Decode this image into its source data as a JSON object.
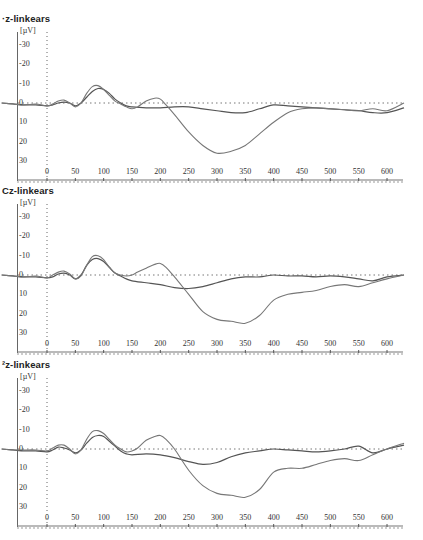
{
  "chart_data": [
    {
      "type": "line",
      "title": "Fz-linkears",
      "title_visible": "·z-linkears",
      "ylabel": "[µV]",
      "xlabel": "",
      "y_inverted": true,
      "ylim": [
        -35,
        35
      ],
      "xlim": [
        -80,
        630
      ],
      "x_ticks": [
        0,
        50,
        100,
        150,
        200,
        250,
        300,
        350,
        400,
        450,
        500,
        550,
        600
      ],
      "y_ticks": [
        -30,
        -20,
        -10,
        0,
        10,
        20,
        30
      ],
      "grid": false,
      "zero_lines": "dotted",
      "legend": null,
      "series": [
        {
          "name": "condition A",
          "color": "#555555",
          "x": [
            -80,
            -60,
            -40,
            -20,
            0,
            10,
            20,
            30,
            40,
            50,
            60,
            70,
            80,
            90,
            100,
            110,
            120,
            130,
            140,
            150,
            175,
            200,
            225,
            250,
            275,
            300,
            325,
            350,
            375,
            400,
            425,
            450,
            475,
            500,
            525,
            550,
            575,
            600,
            630
          ],
          "values": [
            0,
            0.5,
            1,
            1,
            1.5,
            1,
            0,
            -0.5,
            0,
            1.5,
            0,
            -3,
            -6,
            -7.5,
            -7,
            -5,
            -2,
            0,
            1.5,
            2,
            2.5,
            2.5,
            2,
            2,
            3,
            4,
            5,
            5,
            3,
            1,
            1.5,
            2,
            2.5,
            3,
            3.5,
            4,
            5,
            5,
            2.5
          ]
        },
        {
          "name": "condition B",
          "color": "#777777",
          "x": [
            -80,
            -60,
            -40,
            -20,
            0,
            10,
            20,
            30,
            40,
            50,
            60,
            70,
            80,
            90,
            100,
            110,
            120,
            130,
            140,
            150,
            160,
            175,
            190,
            200,
            210,
            225,
            250,
            275,
            300,
            325,
            350,
            375,
            400,
            425,
            450,
            475,
            500,
            525,
            550,
            575,
            600,
            630
          ],
          "values": [
            0,
            0.5,
            1,
            0.5,
            1.5,
            0.5,
            -1,
            -1.5,
            0,
            2,
            0,
            -5,
            -8.5,
            -9,
            -7,
            -4,
            -1,
            0.5,
            2,
            3,
            2,
            -1,
            -2.5,
            -2,
            1,
            6,
            15,
            22,
            26,
            25,
            22,
            16,
            10,
            5,
            3,
            2.5,
            3,
            3.5,
            4,
            3,
            4,
            0
          ]
        }
      ]
    },
    {
      "type": "line",
      "title": "Cz-linkears",
      "title_visible": "Cz-linkears",
      "ylabel": "[µV]",
      "y_inverted": true,
      "ylim": [
        -35,
        35
      ],
      "xlim": [
        -80,
        630
      ],
      "x_ticks": [
        0,
        50,
        100,
        150,
        200,
        250,
        300,
        350,
        400,
        450,
        500,
        550,
        600
      ],
      "y_ticks": [
        -30,
        -20,
        -10,
        0,
        10,
        20,
        30
      ],
      "grid": false,
      "zero_lines": "dotted",
      "legend": null,
      "series": [
        {
          "name": "condition A",
          "color": "#555555",
          "x": [
            -80,
            -60,
            -40,
            -20,
            0,
            10,
            20,
            30,
            40,
            50,
            60,
            70,
            80,
            90,
            100,
            110,
            120,
            130,
            140,
            150,
            175,
            200,
            225,
            250,
            275,
            300,
            325,
            350,
            375,
            400,
            425,
            450,
            475,
            500,
            525,
            550,
            575,
            600,
            630
          ],
          "values": [
            0,
            0.5,
            1,
            1,
            1.5,
            1,
            -0.5,
            -1,
            0,
            2,
            0,
            -5,
            -8,
            -8.5,
            -7,
            -4,
            -1,
            0.5,
            2,
            3,
            4,
            5,
            6.5,
            7,
            6,
            4,
            2,
            1,
            1,
            0,
            0.5,
            0.5,
            1,
            0.5,
            1,
            2,
            3,
            1,
            0
          ]
        },
        {
          "name": "condition B",
          "color": "#777777",
          "x": [
            -80,
            -60,
            -40,
            -20,
            0,
            10,
            20,
            30,
            40,
            50,
            60,
            70,
            80,
            90,
            100,
            110,
            120,
            130,
            140,
            150,
            160,
            175,
            190,
            200,
            210,
            225,
            250,
            275,
            300,
            325,
            350,
            375,
            400,
            425,
            450,
            475,
            500,
            525,
            550,
            575,
            600,
            630
          ],
          "values": [
            0,
            0.5,
            1,
            0.5,
            1.5,
            0,
            -1.5,
            -2,
            -0.5,
            2,
            0.5,
            -5,
            -9.5,
            -10,
            -8,
            -4,
            -1,
            0,
            0.5,
            0,
            -1.5,
            -3.5,
            -5.5,
            -6,
            -4,
            1,
            10,
            19,
            23,
            24,
            25,
            21,
            13,
            10,
            9,
            8,
            6,
            5,
            6,
            4,
            2,
            0
          ]
        }
      ]
    },
    {
      "type": "line",
      "title": "Pz-linkears",
      "title_visible": "²z-linkears",
      "ylabel": "[µV]",
      "y_inverted": true,
      "ylim": [
        -35,
        35
      ],
      "xlim": [
        -80,
        630
      ],
      "x_ticks": [
        0,
        50,
        100,
        150,
        200,
        250,
        300,
        350,
        400,
        450,
        500,
        550,
        600
      ],
      "y_ticks": [
        -30,
        -20,
        -10,
        0,
        10,
        20,
        30
      ],
      "grid": false,
      "zero_lines": "dotted",
      "legend": null,
      "series": [
        {
          "name": "condition A",
          "color": "#555555",
          "x": [
            -80,
            -60,
            -40,
            -20,
            0,
            10,
            20,
            30,
            40,
            50,
            60,
            70,
            80,
            90,
            100,
            110,
            120,
            130,
            140,
            150,
            175,
            200,
            225,
            250,
            275,
            300,
            325,
            350,
            375,
            400,
            425,
            450,
            475,
            500,
            525,
            550,
            575,
            600,
            630
          ],
          "values": [
            0,
            0.5,
            1,
            1,
            1.5,
            0.5,
            -1,
            -0.5,
            0.5,
            2,
            0.5,
            -3,
            -6,
            -7,
            -6.5,
            -4,
            -1.5,
            1,
            2.5,
            3,
            2.5,
            3,
            4.5,
            6.5,
            8,
            7,
            4,
            2,
            1,
            0,
            0.5,
            1,
            1.5,
            1,
            0,
            -1.5,
            2,
            0,
            -2
          ]
        },
        {
          "name": "condition B",
          "color": "#777777",
          "x": [
            -80,
            -60,
            -40,
            -20,
            0,
            10,
            20,
            30,
            40,
            50,
            60,
            70,
            80,
            90,
            100,
            110,
            120,
            130,
            140,
            150,
            160,
            175,
            190,
            200,
            210,
            225,
            250,
            275,
            300,
            325,
            350,
            375,
            400,
            425,
            450,
            475,
            500,
            525,
            550,
            575,
            600,
            630
          ],
          "values": [
            0,
            0.5,
            0.5,
            0.5,
            1,
            -0.5,
            -2,
            -2,
            0,
            2.5,
            0.5,
            -5,
            -9,
            -9.5,
            -8,
            -5,
            -2,
            0,
            1.5,
            1,
            -0.5,
            -4.5,
            -6.5,
            -7,
            -5,
            0,
            11,
            19,
            23,
            24,
            25,
            21,
            12,
            10,
            10,
            8,
            6,
            5,
            6,
            3,
            0,
            -3
          ]
        }
      ]
    }
  ],
  "panels": [
    {
      "title": "·z-linkears",
      "unit": "[µV]",
      "yticks": [
        "-30",
        "-20",
        "-10",
        "0",
        "10",
        "20",
        "30"
      ],
      "xticks": [
        "0",
        "50",
        "100",
        "150",
        "200",
        "250",
        "300",
        "350",
        "400",
        "450",
        "500",
        "550",
        "600"
      ]
    },
    {
      "title": "Cz-linkears",
      "unit": "[µV]",
      "yticks": [
        "-30",
        "-20",
        "-10",
        "0",
        "10",
        "20",
        "30"
      ],
      "xticks": [
        "0",
        "50",
        "100",
        "150",
        "200",
        "250",
        "300",
        "350",
        "400",
        "450",
        "500",
        "550",
        "600"
      ]
    },
    {
      "title": "²z-linkears",
      "unit": "[µV]",
      "yticks": [
        "-30",
        "-20",
        "-10",
        "0",
        "10",
        "20",
        "30"
      ],
      "xticks": [
        "0",
        "50",
        "100",
        "150",
        "200",
        "250",
        "300",
        "350",
        "400",
        "450",
        "500",
        "550",
        "600"
      ]
    }
  ],
  "layout": {
    "panel_tops": [
      12,
      184,
      358
    ],
    "panel_height": 174,
    "x0_px": 47,
    "px_per_ms": 0.5667,
    "zero_offset": 91,
    "px_per_uv": 1.93,
    "plot_right": 403
  }
}
